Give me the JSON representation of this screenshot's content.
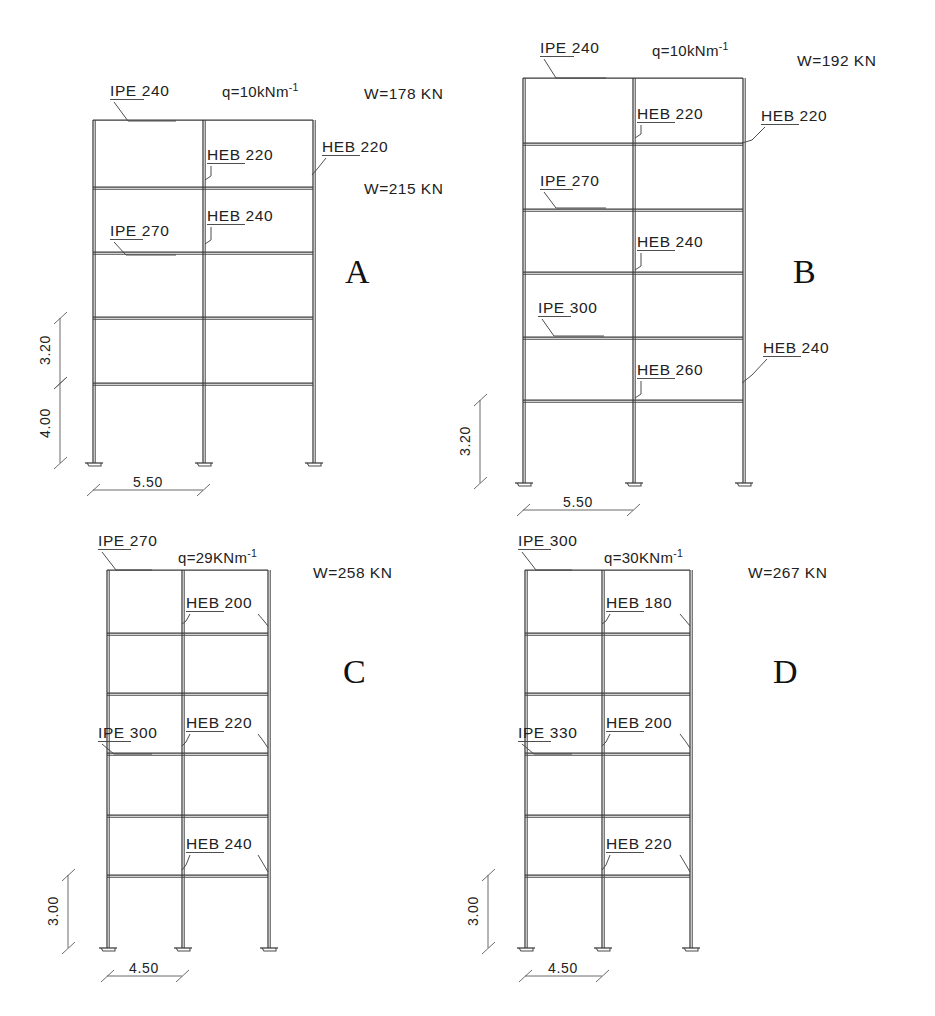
{
  "page": {
    "cut_caption": "",
    "background": "#ffffff",
    "line_color": "#4a4a4a"
  },
  "frames": [
    {
      "id": "A",
      "letter": "A",
      "letter_pos": {
        "x": 345,
        "y": 283
      },
      "stories": 5,
      "geometry": {
        "x_left": 93,
        "x_mid": 203,
        "x_right": 313,
        "y_levels": [
          120,
          187,
          252,
          317,
          383
        ],
        "y_base": 463
      },
      "load_label": "q=10kNm",
      "load_exponent": "-1",
      "load_pos": {
        "x": 222,
        "y": 97
      },
      "weights": [
        {
          "text": "W=178 KN",
          "x": 364,
          "y": 99
        },
        {
          "text": "W=215 KN",
          "x": 364,
          "y": 194
        }
      ],
      "labels": [
        {
          "text": "IPE 240",
          "x": 110,
          "y": 96,
          "underline": true,
          "underline_w": 34,
          "leader": "M114,102 L128,121 L176,121"
        },
        {
          "text": "HEB 220",
          "x": 207,
          "y": 160,
          "underline": true,
          "underline_w": 38,
          "leader": "M211,166 L211,176 L205,180"
        },
        {
          "text": "HEB 220",
          "x": 322,
          "y": 152,
          "underline": true,
          "underline_w": 38,
          "leader": "M326,158 L318,168 L312,175"
        },
        {
          "text": "HEB 240",
          "x": 207,
          "y": 221,
          "underline": true,
          "underline_w": 38,
          "leader": "M211,227 L211,240 L205,244"
        },
        {
          "text": "IPE 270",
          "x": 110,
          "y": 236,
          "underline": true,
          "underline_w": 33,
          "leader": "M114,242 L126,255 L176,255"
        }
      ],
      "dims_vertical": [
        {
          "text": "3.20",
          "y_top": 318,
          "y_bot": 383,
          "x": 60,
          "label_x": 50,
          "label_y": 350
        },
        {
          "text": "4.00",
          "y_top": 383,
          "y_bot": 463,
          "x": 60,
          "label_x": 50,
          "label_y": 423
        }
      ],
      "dims_horizontal": [
        {
          "text": "5.50",
          "x_left": 93,
          "x_right": 203,
          "y": 490,
          "label_x": 148,
          "label_y": 487
        }
      ]
    },
    {
      "id": "B",
      "letter": "B",
      "letter_pos": {
        "x": 793,
        "y": 283
      },
      "stories": 6,
      "geometry": {
        "x_left": 523,
        "x_mid": 633,
        "x_right": 743,
        "y_levels": [
          78,
          143,
          209,
          272,
          337,
          400
        ],
        "y_base": 483
      },
      "load_label": "q=10kNm",
      "load_exponent": "-1",
      "load_pos": {
        "x": 652,
        "y": 56
      },
      "weights": [
        {
          "text": "W=192 KN",
          "x": 797,
          "y": 66
        }
      ],
      "labels": [
        {
          "text": "IPE 240",
          "x": 540,
          "y": 53,
          "underline": true,
          "underline_w": 34,
          "leader": "M544,59 L556,78 L606,78"
        },
        {
          "text": "HEB 220",
          "x": 637,
          "y": 119,
          "underline": true,
          "underline_w": 38,
          "leader": "M641,125 L641,134 L635,138"
        },
        {
          "text": "HEB 220",
          "x": 761,
          "y": 121,
          "underline": true,
          "underline_w": 38,
          "leader": "M765,127 L752,140 L742,143"
        },
        {
          "text": "IPE 270",
          "x": 540,
          "y": 186,
          "underline": true,
          "underline_w": 33,
          "leader": "M544,192 L556,208 L606,208"
        },
        {
          "text": "HEB 240",
          "x": 637,
          "y": 247,
          "underline": true,
          "underline_w": 38,
          "leader": "M641,253 L641,266 L635,270"
        },
        {
          "text": "IPE 300",
          "x": 538,
          "y": 313,
          "underline": true,
          "underline_w": 33,
          "leader": "M542,319 L554,336 L604,336"
        },
        {
          "text": "HEB 260",
          "x": 637,
          "y": 375,
          "underline": true,
          "underline_w": 38,
          "leader": "M641,381 L641,394 L635,398"
        },
        {
          "text": "HEB 240",
          "x": 763,
          "y": 353,
          "underline": true,
          "underline_w": 38,
          "leader": "M767,359 L752,375 L742,383"
        }
      ],
      "dims_vertical": [
        {
          "text": "3.20",
          "y_top": 400,
          "y_bot": 483,
          "x": 480,
          "label_x": 470,
          "label_y": 441
        }
      ],
      "dims_horizontal": [
        {
          "text": "5.50",
          "x_left": 523,
          "x_right": 633,
          "y": 510,
          "label_x": 578,
          "label_y": 507
        }
      ]
    },
    {
      "id": "C",
      "letter": "C",
      "letter_pos": {
        "x": 343,
        "y": 683
      },
      "stories": 6,
      "geometry": {
        "x_left": 107,
        "x_mid": 182,
        "x_right": 268,
        "y_levels": [
          570,
          633,
          693,
          753,
          815,
          875
        ],
        "y_base": 948
      },
      "load_label": "q=29KNm",
      "load_exponent": "-1",
      "load_pos": {
        "x": 178,
        "y": 563
      },
      "weights": [
        {
          "text": "W=258 KN",
          "x": 313,
          "y": 578
        }
      ],
      "labels": [
        {
          "text": "IPE 270",
          "x": 98,
          "y": 546,
          "underline": true,
          "underline_w": 33,
          "leader": "M102,552 L116,570 L152,570"
        },
        {
          "text": "HEB 200",
          "x": 186,
          "y": 608,
          "underline": true,
          "underline_w": 38,
          "leader": "M190,614 L186,621 L182,624",
          "leader2": "M258,614 L264,621 L268,626"
        },
        {
          "text": "HEB 220",
          "x": 186,
          "y": 728,
          "underline": true,
          "underline_w": 38,
          "leader": "M190,734 L186,742 L182,746",
          "leader2": "M258,734 L264,742 L268,748"
        },
        {
          "text": "IPE 300",
          "x": 98,
          "y": 738,
          "underline": true,
          "underline_w": 33,
          "leader": "M102,744 L114,754 L152,754"
        },
        {
          "text": "HEB 240",
          "x": 186,
          "y": 849,
          "underline": true,
          "underline_w": 38,
          "leader": "M190,855 L186,865 L182,870",
          "leader2": "M258,855 L264,865 L268,872"
        }
      ],
      "dims_vertical": [
        {
          "text": "3.00",
          "y_top": 875,
          "y_bot": 948,
          "x": 68,
          "label_x": 58,
          "label_y": 911
        }
      ],
      "dims_horizontal": [
        {
          "text": "4.50",
          "x_left": 107,
          "x_right": 182,
          "y": 976,
          "label_x": 144,
          "label_y": 973
        }
      ]
    },
    {
      "id": "D",
      "letter": "D",
      "letter_pos": {
        "x": 773,
        "y": 683
      },
      "stories": 6,
      "geometry": {
        "x_left": 525,
        "x_mid": 602,
        "x_right": 690,
        "y_levels": [
          570,
          633,
          693,
          753,
          815,
          875
        ],
        "y_base": 948
      },
      "load_label": "q=30KNm",
      "load_exponent": "-1",
      "load_pos": {
        "x": 604,
        "y": 563
      },
      "weights": [
        {
          "text": "W=267 KN",
          "x": 748,
          "y": 578
        }
      ],
      "labels": [
        {
          "text": "IPE 300",
          "x": 518,
          "y": 546,
          "underline": true,
          "underline_w": 33,
          "leader": "M522,552 L536,570 L572,570"
        },
        {
          "text": "HEB 180",
          "x": 606,
          "y": 608,
          "underline": true,
          "underline_w": 38,
          "leader": "M610,614 L606,621 L602,624",
          "leader2": "M680,614 L686,621 L690,626"
        },
        {
          "text": "HEB 200",
          "x": 606,
          "y": 728,
          "underline": true,
          "underline_w": 38,
          "leader": "M610,734 L606,742 L602,746",
          "leader2": "M680,734 L686,742 L690,748"
        },
        {
          "text": "IPE 330",
          "x": 518,
          "y": 738,
          "underline": true,
          "underline_w": 33,
          "leader": "M522,744 L534,754 L572,754"
        },
        {
          "text": "HEB 220",
          "x": 606,
          "y": 849,
          "underline": true,
          "underline_w": 38,
          "leader": "M610,855 L606,865 L602,870",
          "leader2": "M680,855 L686,865 L690,872"
        }
      ],
      "dims_vertical": [
        {
          "text": "3.00",
          "y_top": 875,
          "y_bot": 948,
          "x": 488,
          "label_x": 478,
          "label_y": 911
        }
      ],
      "dims_horizontal": [
        {
          "text": "4.50",
          "x_left": 525,
          "x_right": 602,
          "y": 976,
          "label_x": 563,
          "label_y": 973
        }
      ]
    }
  ]
}
